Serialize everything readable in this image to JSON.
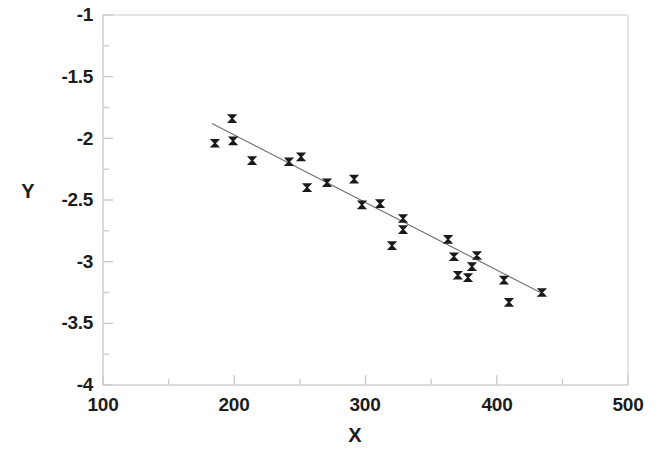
{
  "chart_data": {
    "type": "scatter",
    "title": "",
    "xlabel": "X",
    "ylabel": "Y",
    "xlim": [
      100,
      500
    ],
    "ylim": [
      -4,
      -1
    ],
    "xticks": [
      100,
      200,
      300,
      400,
      500
    ],
    "xtick_labels": [
      "100",
      "200",
      "300",
      "400",
      "500"
    ],
    "yticks": [
      -1,
      -1.5,
      -2,
      -2.5,
      -3,
      -3.5,
      -4
    ],
    "ytick_labels": [
      "-1",
      "-1.5",
      "-2",
      "-2.5",
      "-3",
      "-3.5",
      "-4"
    ],
    "minor_ticks": true,
    "grid": false,
    "legend": null,
    "marker": "x",
    "marker_color": "#1a1a1a",
    "frame_color": "#d8d8d8",
    "series": [
      {
        "name": "observations",
        "type": "scatter",
        "points": [
          [
            198.4,
            -1.84
          ],
          [
            185.3,
            -2.04
          ],
          [
            199.1,
            -2.02
          ],
          [
            213.6,
            -2.18
          ],
          [
            241.7,
            -2.19
          ],
          [
            250.9,
            -2.15
          ],
          [
            255.5,
            -2.4
          ],
          [
            270.7,
            -2.36
          ],
          [
            291.3,
            -2.33
          ],
          [
            297.3,
            -2.54
          ],
          [
            311.1,
            -2.53
          ],
          [
            328.6,
            -2.65
          ],
          [
            328.6,
            -2.74
          ],
          [
            320.2,
            -2.87
          ],
          [
            362.9,
            -2.82
          ],
          [
            367.4,
            -2.96
          ],
          [
            384.9,
            -2.95
          ],
          [
            381.1,
            -3.04
          ],
          [
            370.4,
            -3.11
          ],
          [
            378.1,
            -3.13
          ],
          [
            405.5,
            -3.15
          ],
          [
            409.3,
            -3.33
          ],
          [
            434.4,
            -3.25
          ]
        ]
      },
      {
        "name": "regression-line",
        "type": "line",
        "x_start": 183.0,
        "y_start": -1.88,
        "x_end": 437.0,
        "y_end": -3.27
      }
    ]
  },
  "axes": {
    "y_title": "Y",
    "x_title": "X"
  }
}
